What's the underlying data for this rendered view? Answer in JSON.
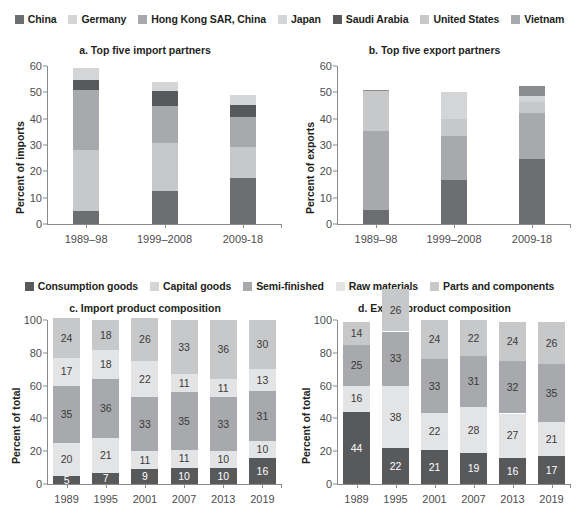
{
  "legend_partners": {
    "name": "partner-legend",
    "items": [
      {
        "label": "China",
        "color": "#6d6e71"
      },
      {
        "label": "Germany",
        "color": "#d4d5d6"
      },
      {
        "label": "Hong Kong SAR, China",
        "color": "#a7a9ac"
      },
      {
        "label": "Japan",
        "color": "#d4d5d6"
      },
      {
        "label": "Saudi Arabia",
        "color": "#58595b"
      },
      {
        "label": "United States",
        "color": "#c7c8ca"
      },
      {
        "label": "Vietnam",
        "color": "#a7a9ac"
      }
    ]
  },
  "legend_products": {
    "name": "product-legend",
    "items": [
      {
        "label": "Consumption goods",
        "color": "#58595b"
      },
      {
        "label": "Capital goods",
        "color": "#d4d5d6"
      },
      {
        "label": "Semi-finished",
        "color": "#a7a9ac"
      },
      {
        "label": "Raw materials",
        "color": "#e3e4e5"
      },
      {
        "label": "Parts and components",
        "color": "#c7c8ca"
      }
    ]
  },
  "chart_data": [
    {
      "id": "a",
      "type": "bar",
      "stacked": true,
      "title": "a. Top five import partners",
      "xlabel": "",
      "ylabel": "Percent of imports",
      "ylim": [
        0,
        60
      ],
      "yticks": [
        0,
        10,
        20,
        30,
        40,
        50,
        60
      ],
      "grid": false,
      "legend_position": "top",
      "categories": [
        "1989–98",
        "1999–2008",
        "2009-18"
      ],
      "series": [
        {
          "name": "China",
          "color": "#6d6e71",
          "values": [
            4.8,
            12.6,
            17.6
          ]
        },
        {
          "name": "United States",
          "color": "#c7c8ca",
          "values": [
            23.2,
            18.2,
            11.5
          ]
        },
        {
          "name": "Hong Kong SAR, China",
          "color": "#a7a9ac",
          "values": [
            22.8,
            14.2,
            11.4
          ]
        },
        {
          "name": "Saudi Arabia",
          "color": "#58595b",
          "values": [
            3.9,
            5.6,
            4.6
          ]
        },
        {
          "name": "Germany",
          "color": "#d4d5d6",
          "values": [
            4.5,
            3.5,
            3.8
          ]
        }
      ],
      "totals": [
        59.2,
        54.1,
        48.9
      ]
    },
    {
      "id": "b",
      "type": "bar",
      "stacked": true,
      "title": "b. Top five export partners",
      "xlabel": "",
      "ylabel": "Percent of exports",
      "ylim": [
        0,
        60
      ],
      "yticks": [
        0,
        10,
        20,
        30,
        40,
        50,
        60
      ],
      "grid": false,
      "legend_position": "top",
      "categories": [
        "1989–98",
        "1999–2008",
        "2009-18"
      ],
      "series": [
        {
          "name": "China",
          "color": "#6d6e71",
          "values": [
            5.3,
            16.6,
            24.6
          ]
        },
        {
          "name": "United States",
          "color": "#a7a9ac",
          "values": [
            30.0,
            16.7,
            17.6
          ]
        },
        {
          "name": "Hong Kong SAR, China",
          "color": "#c7c8ca",
          "values": [
            15.1,
            6.6,
            4.3
          ]
        },
        {
          "name": "Japan",
          "color": "#d4d5d6",
          "values": [
            0.0,
            10.1,
            2.1
          ]
        },
        {
          "name": "Vietnam",
          "color": "#8a8c8e",
          "values": [
            0.4,
            0.0,
            3.9
          ]
        }
      ],
      "totals": [
        50.8,
        50.0,
        52.5
      ]
    },
    {
      "id": "c",
      "type": "bar",
      "stacked": true,
      "title": "c. Import product composition",
      "xlabel": "",
      "ylabel": "Percent of total",
      "ylim": [
        0,
        100
      ],
      "yticks": [
        0,
        20,
        40,
        60,
        80,
        100
      ],
      "grid": false,
      "legend_position": "top",
      "data_labels": true,
      "categories": [
        "1989",
        "1995",
        "2001",
        "2007",
        "2013",
        "2019"
      ],
      "series": [
        {
          "name": "Consumption goods",
          "color": "#58595b",
          "values": [
            5,
            7,
            9,
            10,
            10,
            16
          ]
        },
        {
          "name": "Raw materials",
          "color": "#e3e4e5",
          "values": [
            20,
            21,
            11,
            11,
            10,
            10
          ]
        },
        {
          "name": "Parts and components",
          "color": "#a7a9ac",
          "values": [
            35,
            36,
            33,
            35,
            33,
            31
          ]
        },
        {
          "name": "Capital goods",
          "color": "#e3e4e5",
          "values": [
            17,
            18,
            22,
            11,
            11,
            13
          ]
        },
        {
          "name": "Semi-finished",
          "color": "#c7c8ca",
          "values": [
            24,
            18,
            26,
            33,
            36,
            30
          ]
        }
      ]
    },
    {
      "id": "d",
      "type": "bar",
      "stacked": true,
      "title": "d. Export product composition",
      "xlabel": "",
      "ylabel": "Percent of total",
      "ylim": [
        0,
        100
      ],
      "yticks": [
        0,
        20,
        40,
        60,
        80,
        100
      ],
      "grid": false,
      "legend_position": "top",
      "data_labels": true,
      "categories": [
        "1989",
        "1995",
        "2001",
        "2007",
        "2013",
        "2019"
      ],
      "series": [
        {
          "name": "Consumption goods",
          "color": "#58595b",
          "values": [
            44,
            22,
            21,
            19,
            16,
            17
          ]
        },
        {
          "name": "Raw materials",
          "color": "#e3e4e5",
          "values": [
            16,
            38,
            22,
            28,
            27,
            21
          ]
        },
        {
          "name": "Parts and components",
          "color": "#a7a9ac",
          "values": [
            25,
            33,
            33,
            31,
            32,
            35
          ]
        },
        {
          "name": "Semi-finished",
          "color": "#c7c8ca",
          "values": [
            14,
            26,
            24,
            22,
            24,
            26
          ]
        }
      ]
    }
  ]
}
